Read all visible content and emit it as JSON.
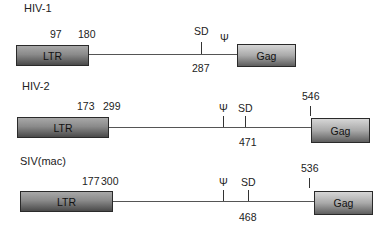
{
  "diagrams": [
    {
      "name": "HIV-1",
      "ltr_label": "LTR",
      "gag_label": "Gag",
      "ltr_positions": [
        "97",
        "180"
      ],
      "sd_label": "SD",
      "sd_position": "287",
      "psi_label": "Ψ"
    },
    {
      "name": "HIV-2",
      "ltr_label": "LTR",
      "gag_label": "Gag",
      "ltr_positions": [
        "173",
        "299"
      ],
      "psi_label": "Ψ",
      "sd_label": "SD",
      "sd_position": "471",
      "gag_start_position": "546"
    },
    {
      "name": "SIV(mac)",
      "ltr_label": "LTR",
      "gag_label": "Gag",
      "ltr_positions": [
        "177",
        "300"
      ],
      "psi_label": "Ψ",
      "sd_label": "SD",
      "sd_position": "468",
      "gag_start_position": "536"
    }
  ]
}
